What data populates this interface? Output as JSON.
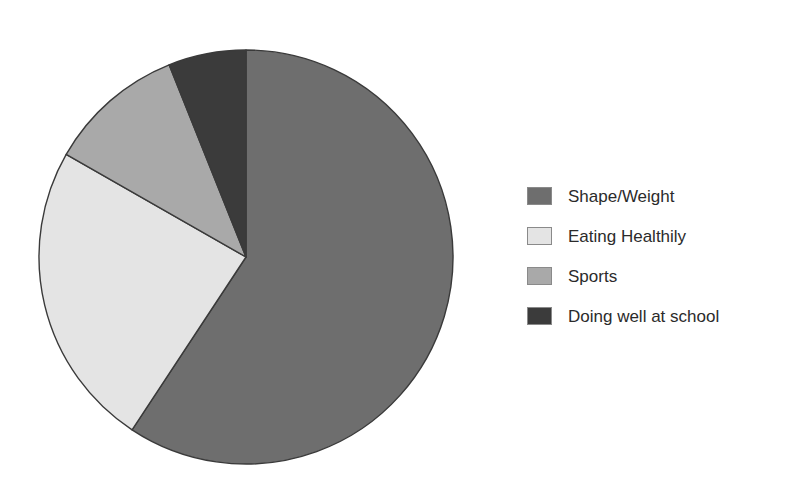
{
  "chart_data": {
    "type": "pie",
    "title": "",
    "subtitle": "",
    "xlabel": "",
    "ylabel": "",
    "grid": false,
    "legend_position": "right",
    "start_angle_deg": 0,
    "direction": "clockwise",
    "categories": [
      "Shape/Weight",
      "Eating Healthily",
      "Sports",
      "Doing well at school"
    ],
    "values": [
      59.3,
      24.0,
      10.7,
      6.0
    ],
    "units": "percent",
    "colors": [
      "#6e6e6e",
      "#e4e4e4",
      "#a9a9a9",
      "#3b3b3b"
    ],
    "slice_outline_color": "#3a3a3a",
    "slice_boundaries_deg": [
      0,
      213.4,
      299.7,
      338.2,
      360
    ],
    "series": [
      {
        "name": "Response share",
        "values": [
          59.3,
          24.0,
          10.7,
          6.0
        ]
      }
    ],
    "slices": [
      {
        "label": "Shape/Weight",
        "value": 59.3,
        "color": "#6e6e6e",
        "start_deg": 0,
        "end_deg": 213.4
      },
      {
        "label": "Eating Healthily",
        "value": 24.0,
        "color": "#e4e4e4",
        "start_deg": 213.4,
        "end_deg": 299.7
      },
      {
        "label": "Sports",
        "value": 10.7,
        "color": "#a9a9a9",
        "start_deg": 299.7,
        "end_deg": 338.2
      },
      {
        "label": "Doing well at school",
        "value": 6.0,
        "color": "#3b3b3b",
        "start_deg": 338.2,
        "end_deg": 360
      }
    ],
    "geometry": {
      "center_x": 246,
      "center_y": 257,
      "radius": 207
    }
  },
  "legend": {
    "items": [
      {
        "label": "Shape/Weight",
        "color": "#6e6e6e"
      },
      {
        "label": "Eating Healthily",
        "color": "#e4e4e4"
      },
      {
        "label": "Sports",
        "color": "#a9a9a9"
      },
      {
        "label": "Doing well at school",
        "color": "#3b3b3b"
      }
    ]
  },
  "page": {
    "background_color": "#ffffff"
  }
}
